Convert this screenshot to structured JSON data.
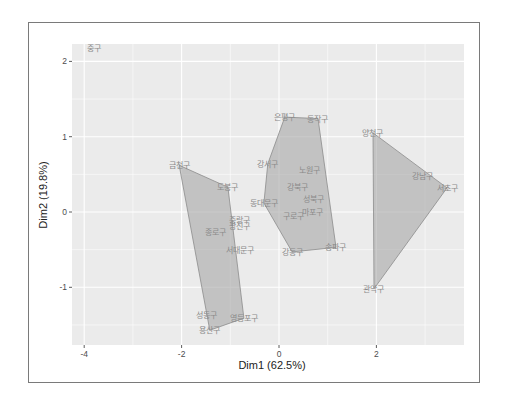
{
  "chart_data": {
    "type": "scatter",
    "title": "",
    "xlabel": "Dim1 (62.5%)",
    "ylabel": "Dim2 (19.8%)",
    "xlim": [
      -4.2,
      3.8
    ],
    "ylim": [
      -1.78,
      2.23
    ],
    "x_ticks": [
      -4,
      -2,
      0,
      2
    ],
    "y_ticks": [
      -1,
      0,
      1,
      2
    ],
    "grid": true,
    "legend": "none",
    "points": [
      {
        "label": "중구",
        "x": -3.8,
        "y": 2.18
      },
      {
        "label": "금천구",
        "x": -2.05,
        "y": 0.62
      },
      {
        "label": "도봉구",
        "x": -1.05,
        "y": 0.33
      },
      {
        "label": "중랑구",
        "x": -0.82,
        "y": -0.1
      },
      {
        "label": "광진구",
        "x": -0.82,
        "y": -0.18
      },
      {
        "label": "종로구",
        "x": -1.31,
        "y": -0.27
      },
      {
        "label": "서대문구",
        "x": -0.8,
        "y": -0.5
      },
      {
        "label": "성동구",
        "x": -1.48,
        "y": -1.37
      },
      {
        "label": "용산구",
        "x": -1.42,
        "y": -1.57
      },
      {
        "label": "영등포구",
        "x": -0.72,
        "y": -1.41
      },
      {
        "label": "은평구",
        "x": 0.12,
        "y": 1.26
      },
      {
        "label": "동작구",
        "x": 0.8,
        "y": 1.24
      },
      {
        "label": "강서구",
        "x": -0.23,
        "y": 0.64
      },
      {
        "label": "노원구",
        "x": 0.62,
        "y": 0.56
      },
      {
        "label": "강북구",
        "x": 0.39,
        "y": 0.33
      },
      {
        "label": "동대문구",
        "x": -0.31,
        "y": 0.12
      },
      {
        "label": "성북구",
        "x": 0.7,
        "y": 0.17
      },
      {
        "label": "구로구",
        "x": 0.29,
        "y": -0.05
      },
      {
        "label": "마포구",
        "x": 0.68,
        "y": 0.0
      },
      {
        "label": "강동구",
        "x": 0.27,
        "y": -0.53
      },
      {
        "label": "송파구",
        "x": 1.17,
        "y": -0.47
      },
      {
        "label": "양천구",
        "x": 1.93,
        "y": 1.05
      },
      {
        "label": "강남구",
        "x": 2.94,
        "y": 0.48
      },
      {
        "label": "서초구",
        "x": 3.45,
        "y": 0.32
      },
      {
        "label": "관악구",
        "x": 1.95,
        "y": -1.02
      }
    ],
    "clusters": [
      {
        "name": "cluster-1",
        "hull": [
          [
            -2.05,
            0.62
          ],
          [
            -1.05,
            0.33
          ],
          [
            -0.72,
            -1.41
          ],
          [
            -1.42,
            -1.57
          ]
        ],
        "members": [
          "금천구",
          "도봉구",
          "중랑구",
          "광진구",
          "종로구",
          "서대문구",
          "성동구",
          "용산구",
          "영등포구"
        ]
      },
      {
        "name": "cluster-2",
        "hull": [
          [
            0.12,
            1.26
          ],
          [
            0.8,
            1.24
          ],
          [
            1.17,
            -0.47
          ],
          [
            0.27,
            -0.53
          ],
          [
            -0.31,
            0.12
          ],
          [
            -0.23,
            0.64
          ]
        ],
        "members": [
          "은평구",
          "동작구",
          "강서구",
          "노원구",
          "강북구",
          "동대문구",
          "성북구",
          "구로구",
          "마포구",
          "강동구",
          "송파구"
        ]
      },
      {
        "name": "cluster-3",
        "hull": [
          [
            1.93,
            1.05
          ],
          [
            3.45,
            0.32
          ],
          [
            1.95,
            -1.02
          ]
        ],
        "members": [
          "양천구",
          "강남구",
          "서초구",
          "관악구"
        ]
      },
      {
        "name": "cluster-4",
        "hull": [],
        "members": [
          "중구"
        ]
      }
    ]
  },
  "colors": {
    "panel_bg": "#ebebeb",
    "grid_major": "#ffffff",
    "hull_fill": "#a6a6a6",
    "hull_stroke": "#8c8c8c",
    "label": "#8a8a8a"
  }
}
